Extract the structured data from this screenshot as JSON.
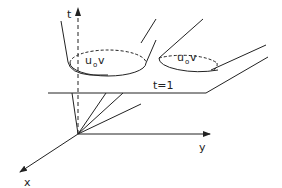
{
  "diagram": {
    "axes": {
      "t_label": "t",
      "x_label": "x",
      "y_label": "y"
    },
    "plane_label": "t=1",
    "cones": [
      {
        "label_u": "u",
        "label_sub": "o",
        "label_v": "v"
      },
      {
        "label_u": "u",
        "label_sub": "o",
        "label_v": "v"
      }
    ],
    "colors": {
      "stroke": "#222222",
      "background": "#ffffff"
    }
  }
}
